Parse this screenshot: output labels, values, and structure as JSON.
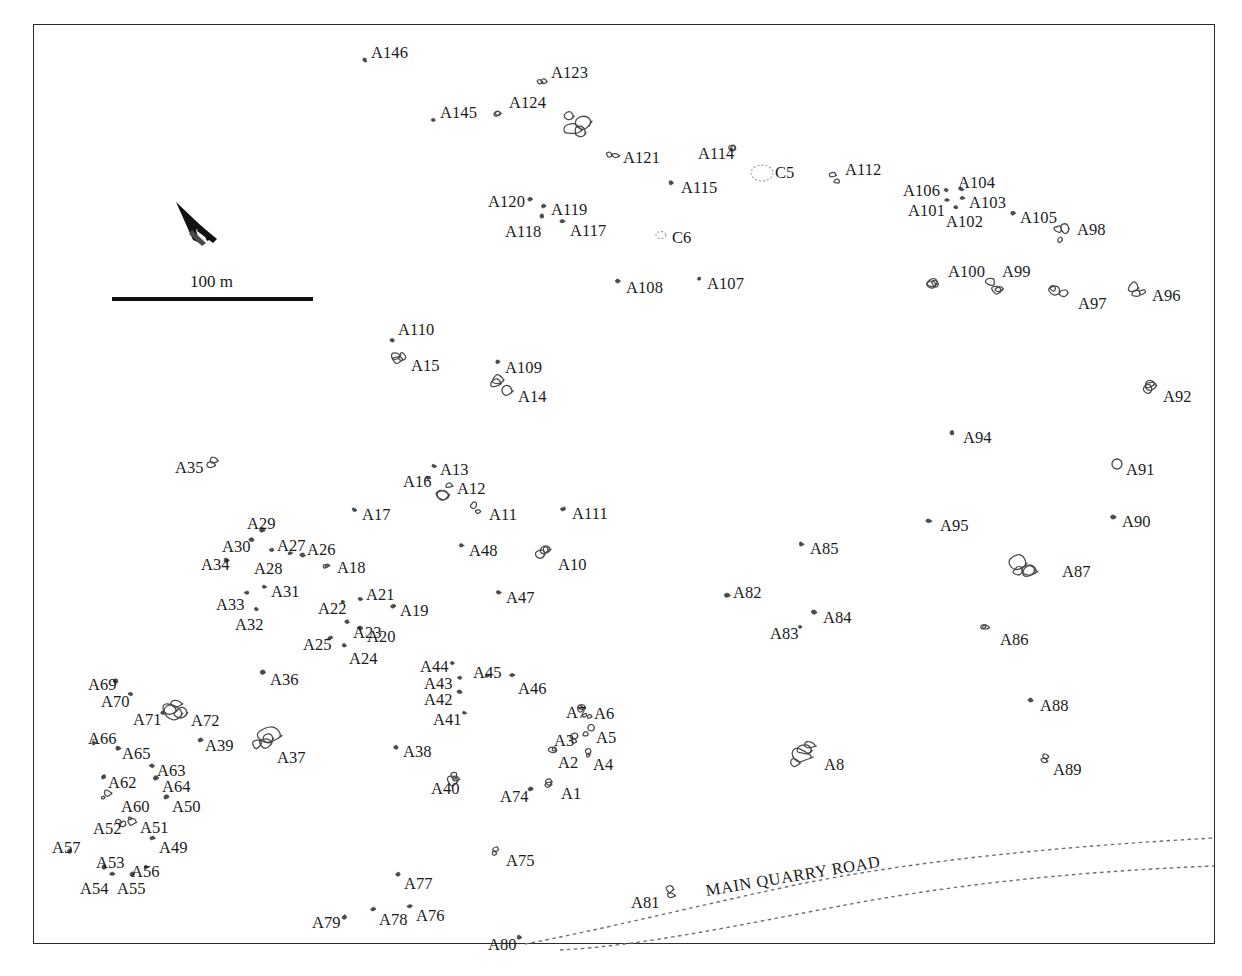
{
  "map": {
    "title": "Archaeological site plan",
    "frame": {
      "x": 33,
      "y": 24,
      "width": 1182,
      "height": 920,
      "border_color": "#2a2a2a"
    },
    "background_color": "#ffffff",
    "feature_color": "#4a4a4a",
    "label_color": "#1b1b1b"
  },
  "scale": {
    "label": "100 m",
    "bar_length_px": 201,
    "bar_x": 112,
    "bar_y": 297
  },
  "north_arrow": {
    "name": "north-arrow",
    "x": 178,
    "y": 200,
    "angle_deg": 38
  },
  "road": {
    "label": "MAIN QUARRY ROAD",
    "style": "dotted",
    "rotation_deg": -9.5
  },
  "legend_note": "",
  "features": [
    {
      "id": "A146",
      "lx": 371,
      "ly": 45,
      "px": 365,
      "py": 60,
      "shape": "dot"
    },
    {
      "id": "A145",
      "lx": 440,
      "ly": 105,
      "px": 433,
      "py": 120,
      "shape": "dot"
    },
    {
      "id": "A124",
      "lx": 509,
      "ly": 95,
      "px": 499,
      "py": 113,
      "shape": "blob-s"
    },
    {
      "id": "A123",
      "lx": 551,
      "ly": 65,
      "px": 543,
      "py": 79,
      "shape": "blob-s"
    },
    {
      "id": "A122",
      "lx": 0,
      "ly": 0,
      "px": 574,
      "py": 122,
      "shape": "blob-l",
      "unlabeled": true
    },
    {
      "id": "A121",
      "lx": 623,
      "ly": 150,
      "px": 612,
      "py": 158,
      "shape": "blob-s"
    },
    {
      "id": "A114",
      "lx": 698,
      "ly": 146,
      "px": 735,
      "py": 150,
      "shape": "blob-s"
    },
    {
      "id": "C5",
      "lx": 775,
      "ly": 165,
      "px": 762,
      "py": 173,
      "shape": "circle-dotted",
      "r": 11
    },
    {
      "id": "A112",
      "lx": 845,
      "ly": 162,
      "px": 834,
      "py": 178,
      "shape": "blob-s"
    },
    {
      "id": "A115",
      "lx": 681,
      "ly": 180,
      "px": 671,
      "py": 183,
      "shape": "dot"
    },
    {
      "id": "A106",
      "lx": 903,
      "ly": 183,
      "px": 946,
      "py": 190,
      "shape": "dot"
    },
    {
      "id": "A104",
      "lx": 958,
      "ly": 175,
      "px": 961,
      "py": 189,
      "shape": "dot"
    },
    {
      "id": "A103",
      "lx": 969,
      "ly": 195,
      "px": 962,
      "py": 198,
      "shape": "dot"
    },
    {
      "id": "A101",
      "lx": 908,
      "ly": 203,
      "px": 947,
      "py": 200,
      "shape": "dot"
    },
    {
      "id": "A102",
      "lx": 946,
      "ly": 214,
      "px": 956,
      "py": 207,
      "shape": "dot"
    },
    {
      "id": "A105",
      "lx": 1020,
      "ly": 210,
      "px": 1013,
      "py": 213,
      "shape": "dot"
    },
    {
      "id": "A98",
      "lx": 1077,
      "ly": 222,
      "px": 1064,
      "py": 233,
      "shape": "blob-m"
    },
    {
      "id": "A120",
      "lx": 488,
      "ly": 194,
      "px": 530,
      "py": 199,
      "shape": "dot"
    },
    {
      "id": "A119",
      "lx": 551,
      "ly": 202,
      "px": 544,
      "py": 206,
      "shape": "dot"
    },
    {
      "id": "A118",
      "lx": 505,
      "ly": 224,
      "px": 542,
      "py": 216,
      "shape": "dot"
    },
    {
      "id": "A117",
      "lx": 570,
      "ly": 223,
      "px": 562,
      "py": 221,
      "shape": "dot"
    },
    {
      "id": "C6",
      "lx": 672,
      "ly": 230,
      "px": 661,
      "py": 235,
      "shape": "circle-dotted",
      "r": 5
    },
    {
      "id": "A108",
      "lx": 626,
      "ly": 280,
      "px": 618,
      "py": 281,
      "shape": "dot"
    },
    {
      "id": "A107",
      "lx": 707,
      "ly": 276,
      "px": 699,
      "py": 279,
      "shape": "dot"
    },
    {
      "id": "A100",
      "lx": 948,
      "ly": 264,
      "px": 932,
      "py": 281,
      "shape": "blob-m"
    },
    {
      "id": "A99",
      "lx": 1002,
      "ly": 264,
      "px": 993,
      "py": 283,
      "shape": "blob-m"
    },
    {
      "id": "A97",
      "lx": 1078,
      "ly": 296,
      "px": 1058,
      "py": 293,
      "shape": "blob-m"
    },
    {
      "id": "A96",
      "lx": 1152,
      "ly": 288,
      "px": 1137,
      "py": 292,
      "shape": "blob-m"
    },
    {
      "id": "A110",
      "lx": 398,
      "ly": 322,
      "px": 392,
      "py": 340,
      "shape": "dot"
    },
    {
      "id": "A15",
      "lx": 411,
      "ly": 358,
      "px": 398,
      "py": 362,
      "shape": "blob-m"
    },
    {
      "id": "A109",
      "lx": 505,
      "ly": 360,
      "px": 498,
      "py": 362,
      "shape": "dot"
    },
    {
      "id": "A14",
      "lx": 518,
      "ly": 389,
      "px": 502,
      "py": 386,
      "shape": "blob-m"
    },
    {
      "id": "A92",
      "lx": 1163,
      "ly": 389,
      "px": 1150,
      "py": 389,
      "shape": "blob-m"
    },
    {
      "id": "A94",
      "lx": 963,
      "ly": 430,
      "px": 952,
      "py": 433,
      "shape": "dot"
    },
    {
      "id": "A91",
      "lx": 1126,
      "ly": 462,
      "px": 1117,
      "py": 464,
      "shape": "circle-open",
      "r": 5
    },
    {
      "id": "A35",
      "lx": 175,
      "ly": 460,
      "px": 212,
      "py": 462,
      "shape": "blob-s"
    },
    {
      "id": "A13",
      "lx": 440,
      "ly": 462,
      "px": 434,
      "py": 466,
      "shape": "dot"
    },
    {
      "id": "A16",
      "lx": 403,
      "ly": 474,
      "px": 428,
      "py": 478,
      "shape": "dot"
    },
    {
      "id": "A12",
      "lx": 457,
      "ly": 481,
      "px": 444,
      "py": 492,
      "shape": "blob-m"
    },
    {
      "id": "A11",
      "lx": 489,
      "ly": 507,
      "px": 477,
      "py": 508,
      "shape": "blob-s"
    },
    {
      "id": "A111",
      "lx": 572,
      "ly": 506,
      "px": 563,
      "py": 509,
      "shape": "dot"
    },
    {
      "id": "A95",
      "lx": 940,
      "ly": 518,
      "px": 929,
      "py": 521,
      "shape": "dot"
    },
    {
      "id": "A90",
      "lx": 1122,
      "ly": 514,
      "px": 1113,
      "py": 517,
      "shape": "dot"
    },
    {
      "id": "A17",
      "lx": 362,
      "ly": 507,
      "px": 354,
      "py": 510,
      "shape": "dot"
    },
    {
      "id": "A29",
      "lx": 247,
      "ly": 516,
      "px": 262,
      "py": 530,
      "shape": "dot"
    },
    {
      "id": "A30",
      "lx": 222,
      "ly": 539,
      "px": 251,
      "py": 540,
      "shape": "dot"
    },
    {
      "id": "A27",
      "lx": 277,
      "ly": 538,
      "px": 272,
      "py": 550,
      "shape": "dot"
    },
    {
      "id": "A26",
      "lx": 307,
      "ly": 542,
      "px": 302,
      "py": 555,
      "shape": "dot"
    },
    {
      "id": "A34",
      "lx": 201,
      "ly": 557,
      "px": 226,
      "py": 560,
      "shape": "dot"
    },
    {
      "id": "A28",
      "lx": 254,
      "ly": 561,
      "px": 290,
      "py": 553,
      "shape": "dot"
    },
    {
      "id": "A18",
      "lx": 337,
      "ly": 560,
      "px": 327,
      "py": 563,
      "shape": "blob-s"
    },
    {
      "id": "A48",
      "lx": 469,
      "ly": 543,
      "px": 461,
      "py": 545,
      "shape": "dot"
    },
    {
      "id": "A10",
      "lx": 558,
      "ly": 557,
      "px": 540,
      "py": 554,
      "shape": "blob-m"
    },
    {
      "id": "A85",
      "lx": 810,
      "ly": 541,
      "px": 801,
      "py": 544,
      "shape": "dot"
    },
    {
      "id": "A87",
      "lx": 1062,
      "ly": 564,
      "px": 1022,
      "py": 565,
      "shape": "blob-l"
    },
    {
      "id": "A31",
      "lx": 271,
      "ly": 584,
      "px": 264,
      "py": 587,
      "shape": "dot"
    },
    {
      "id": "A33",
      "lx": 216,
      "ly": 597,
      "px": 247,
      "py": 593,
      "shape": "dot"
    },
    {
      "id": "A21",
      "lx": 366,
      "ly": 587,
      "px": 360,
      "py": 599,
      "shape": "dot"
    },
    {
      "id": "A22",
      "lx": 318,
      "ly": 601,
      "px": 343,
      "py": 602,
      "shape": "dot"
    },
    {
      "id": "A19",
      "lx": 400,
      "ly": 603,
      "px": 393,
      "py": 606,
      "shape": "dot"
    },
    {
      "id": "A32",
      "lx": 235,
      "ly": 617,
      "px": 256,
      "py": 609,
      "shape": "dot"
    },
    {
      "id": "A82",
      "lx": 733,
      "ly": 585,
      "px": 727,
      "py": 595,
      "shape": "dot"
    },
    {
      "id": "A84",
      "lx": 823,
      "ly": 610,
      "px": 814,
      "py": 612,
      "shape": "dot"
    },
    {
      "id": "A83",
      "lx": 770,
      "ly": 626,
      "px": 800,
      "py": 627,
      "shape": "dot"
    },
    {
      "id": "A86",
      "lx": 1000,
      "ly": 632,
      "px": 987,
      "py": 630,
      "shape": "blob-s"
    },
    {
      "id": "A47",
      "lx": 506,
      "ly": 590,
      "px": 498,
      "py": 592,
      "shape": "dot"
    },
    {
      "id": "A23",
      "lx": 353,
      "ly": 625,
      "px": 347,
      "py": 622,
      "shape": "dot"
    },
    {
      "id": "A20",
      "lx": 367,
      "ly": 629,
      "px": 360,
      "py": 628,
      "shape": "dot"
    },
    {
      "id": "A25",
      "lx": 303,
      "ly": 637,
      "px": 330,
      "py": 638,
      "shape": "dot"
    },
    {
      "id": "A24",
      "lx": 349,
      "ly": 651,
      "px": 344,
      "py": 645,
      "shape": "dot"
    },
    {
      "id": "A44",
      "lx": 420,
      "ly": 659,
      "px": 452,
      "py": 663,
      "shape": "dot"
    },
    {
      "id": "A45",
      "lx": 473,
      "ly": 665,
      "px": 487,
      "py": 676,
      "shape": "dot"
    },
    {
      "id": "A43",
      "lx": 424,
      "ly": 676,
      "px": 460,
      "py": 678,
      "shape": "dot"
    },
    {
      "id": "A46",
      "lx": 518,
      "ly": 681,
      "px": 512,
      "py": 675,
      "shape": "dot"
    },
    {
      "id": "A36",
      "lx": 270,
      "ly": 672,
      "px": 263,
      "py": 672,
      "shape": "dot"
    },
    {
      "id": "A69",
      "lx": 88,
      "ly": 677,
      "px": 116,
      "py": 681,
      "shape": "dot"
    },
    {
      "id": "A42",
      "lx": 424,
      "ly": 692,
      "px": 459,
      "py": 692,
      "shape": "dot"
    },
    {
      "id": "A70",
      "lx": 101,
      "ly": 694,
      "px": 131,
      "py": 694,
      "shape": "dot"
    },
    {
      "id": "A7",
      "lx": 566,
      "ly": 705,
      "px": 582,
      "py": 709,
      "shape": "blob-s"
    },
    {
      "id": "A6",
      "lx": 594,
      "ly": 706,
      "px": 588,
      "py": 717,
      "shape": "blob-s"
    },
    {
      "id": "A41",
      "lx": 433,
      "ly": 712,
      "px": 464,
      "py": 713,
      "shape": "dot"
    },
    {
      "id": "A71",
      "lx": 133,
      "ly": 712,
      "px": 163,
      "py": 713,
      "shape": "dot"
    },
    {
      "id": "A72",
      "lx": 191,
      "ly": 713,
      "px": 177,
      "py": 712,
      "shape": "blob-l"
    },
    {
      "id": "A3",
      "lx": 554,
      "ly": 733,
      "px": 577,
      "py": 737,
      "shape": "blob-s"
    },
    {
      "id": "A5",
      "lx": 596,
      "ly": 730,
      "px": 589,
      "py": 731,
      "shape": "blob-s"
    },
    {
      "id": "A66",
      "lx": 88,
      "ly": 731,
      "px": 94,
      "py": 743,
      "shape": "dot"
    },
    {
      "id": "A39",
      "lx": 205,
      "ly": 738,
      "px": 200,
      "py": 740,
      "shape": "dot"
    },
    {
      "id": "A88",
      "lx": 1040,
      "ly": 698,
      "px": 1030,
      "py": 700,
      "shape": "dot"
    },
    {
      "id": "A65",
      "lx": 122,
      "ly": 746,
      "px": 118,
      "py": 748,
      "shape": "dot"
    },
    {
      "id": "A37",
      "lx": 277,
      "ly": 750,
      "px": 264,
      "py": 740,
      "shape": "blob-l"
    },
    {
      "id": "A2",
      "lx": 558,
      "ly": 755,
      "px": 551,
      "py": 752,
      "shape": "blob-s"
    },
    {
      "id": "A4",
      "lx": 593,
      "ly": 757,
      "px": 587,
      "py": 752,
      "shape": "blob-s"
    },
    {
      "id": "A38",
      "lx": 403,
      "ly": 744,
      "px": 396,
      "py": 747,
      "shape": "dot"
    },
    {
      "id": "A8",
      "lx": 824,
      "ly": 757,
      "px": 803,
      "py": 755,
      "shape": "blob-l"
    },
    {
      "id": "A89",
      "lx": 1053,
      "ly": 762,
      "px": 1042,
      "py": 760,
      "shape": "blob-s"
    },
    {
      "id": "A63",
      "lx": 157,
      "ly": 763,
      "px": 152,
      "py": 766,
      "shape": "dot"
    },
    {
      "id": "A62",
      "lx": 108,
      "ly": 775,
      "px": 104,
      "py": 777,
      "shape": "dot"
    },
    {
      "id": "A64",
      "lx": 162,
      "ly": 779,
      "px": 156,
      "py": 778,
      "shape": "dot"
    },
    {
      "id": "A40",
      "lx": 431,
      "ly": 781,
      "px": 457,
      "py": 776,
      "shape": "blob-m"
    },
    {
      "id": "A74",
      "lx": 500,
      "ly": 789,
      "px": 530,
      "py": 789,
      "shape": "dot"
    },
    {
      "id": "A1",
      "lx": 561,
      "ly": 786,
      "px": 547,
      "py": 781,
      "shape": "blob-s"
    },
    {
      "id": "A60",
      "lx": 121,
      "ly": 799,
      "px": 105,
      "py": 797,
      "shape": "blob-s"
    },
    {
      "id": "A50",
      "lx": 172,
      "ly": 799,
      "px": 166,
      "py": 797,
      "shape": "dot"
    },
    {
      "id": "A52",
      "lx": 93,
      "ly": 821,
      "px": 121,
      "py": 822,
      "shape": "blob-s"
    },
    {
      "id": "A51",
      "lx": 140,
      "ly": 820,
      "px": 133,
      "py": 821,
      "shape": "blob-s"
    },
    {
      "id": "A57",
      "lx": 52,
      "ly": 840,
      "px": 70,
      "py": 851,
      "shape": "dot"
    },
    {
      "id": "A49",
      "lx": 159,
      "ly": 840,
      "px": 152,
      "py": 838,
      "shape": "dot"
    },
    {
      "id": "A75",
      "lx": 506,
      "ly": 853,
      "px": 494,
      "py": 851,
      "shape": "blob-s"
    },
    {
      "id": "A53",
      "lx": 96,
      "ly": 855,
      "px": 104,
      "py": 867,
      "shape": "dot"
    },
    {
      "id": "A56",
      "lx": 131,
      "ly": 864,
      "px": 146,
      "py": 867,
      "shape": "dot"
    },
    {
      "id": "A54",
      "lx": 80,
      "ly": 881,
      "px": 112,
      "py": 874,
      "shape": "dot"
    },
    {
      "id": "A55",
      "lx": 117,
      "ly": 881,
      "px": 132,
      "py": 874,
      "shape": "dot"
    },
    {
      "id": "A77",
      "lx": 404,
      "ly": 876,
      "px": 398,
      "py": 874,
      "shape": "dot"
    },
    {
      "id": "A81",
      "lx": 631,
      "ly": 895,
      "px": 670,
      "py": 893,
      "shape": "blob-s"
    },
    {
      "id": "A78",
      "lx": 379,
      "ly": 912,
      "px": 373,
      "py": 909,
      "shape": "dot"
    },
    {
      "id": "A76",
      "lx": 416,
      "ly": 908,
      "px": 410,
      "py": 906,
      "shape": "dot"
    },
    {
      "id": "A79",
      "lx": 312,
      "ly": 915,
      "px": 344,
      "py": 917,
      "shape": "dot"
    },
    {
      "id": "A80",
      "lx": 488,
      "ly": 937,
      "px": 519,
      "py": 937,
      "shape": "dot"
    }
  ]
}
